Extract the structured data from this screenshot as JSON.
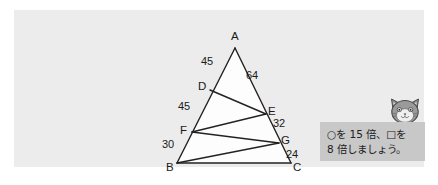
{
  "panel": {
    "background_color": "#ececec",
    "page_background": "#ffffff"
  },
  "figure": {
    "title": "",
    "shape_fill": "#fdfdfd",
    "line_color": "#222222",
    "vertices": [
      {
        "name": "A",
        "label": "A",
        "x": 221,
        "y": 38
      },
      {
        "name": "B",
        "label": "B",
        "x": 163,
        "y": 153
      },
      {
        "name": "C",
        "label": "C",
        "x": 277,
        "y": 153
      },
      {
        "name": "D",
        "label": "D",
        "x": 196,
        "y": 80
      },
      {
        "name": "E",
        "label": "E",
        "x": 252,
        "y": 104
      },
      {
        "name": "F",
        "label": "F",
        "x": 178,
        "y": 122
      },
      {
        "name": "G",
        "label": "G",
        "x": 265,
        "y": 133
      }
    ],
    "segment_labels": [
      {
        "name": "label-AD",
        "value": "45",
        "x": 194,
        "y": 53
      },
      {
        "name": "label-AE",
        "value": "64",
        "x": 236,
        "y": 65
      },
      {
        "name": "label-DF",
        "value": "45",
        "x": 172,
        "y": 99
      },
      {
        "name": "label-EG",
        "value": "32",
        "x": 261,
        "y": 115
      },
      {
        "name": "label-FB",
        "value": "30",
        "x": 155,
        "y": 135
      },
      {
        "name": "label-GC",
        "value": "24",
        "x": 273,
        "y": 145
      }
    ],
    "edges": [
      {
        "name": "edge-A-B",
        "from": "A",
        "to": "B"
      },
      {
        "name": "edge-A-C",
        "from": "A",
        "to": "C"
      },
      {
        "name": "edge-B-C",
        "from": "B",
        "to": "C"
      },
      {
        "name": "edge-D-E",
        "from": "D",
        "to": "E"
      },
      {
        "name": "edge-F-E",
        "from": "F",
        "to": "E"
      },
      {
        "name": "edge-F-G",
        "from": "F",
        "to": "G"
      },
      {
        "name": "edge-B-G",
        "from": "B",
        "to": "G"
      }
    ]
  },
  "callout": {
    "background_color": "#c8c8c8",
    "line1": "○を 15 倍、□を",
    "line2": "8 倍しましょう。",
    "text": "○を 15 倍、□を 8 倍しましょう。"
  },
  "mascot": {
    "name": "cat-face-icon",
    "description": "cat face mascot"
  }
}
